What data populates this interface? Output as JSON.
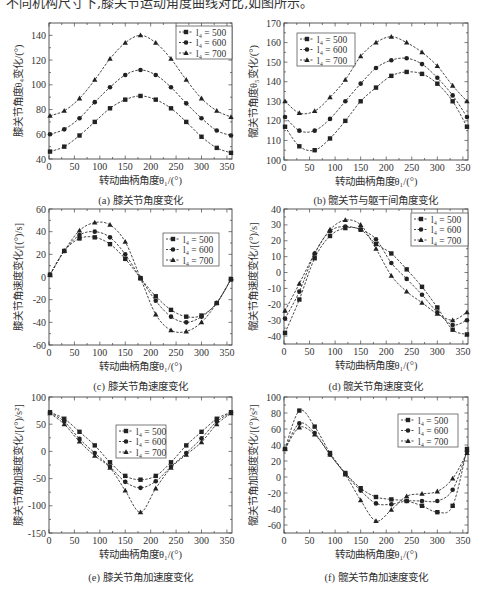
{
  "header": {
    "cropped_text": "不同机构尺寸下,膝关节运动角度曲线对比,如图所示。"
  },
  "common": {
    "xlabel": "转动曲柄角度θ₁/(°)",
    "xticks": [
      0,
      50,
      100,
      150,
      200,
      250,
      300,
      350
    ],
    "legend": [
      "l₄ = 500",
      "l₄ = 600",
      "l₄ = 700"
    ],
    "markers": [
      "square",
      "circle",
      "triangle"
    ]
  },
  "chart_data": [
    {
      "id": "a",
      "type": "line",
      "title": "(a) 膝关节角度变化",
      "xlabel": "转动曲柄角度θ₁/(°)",
      "ylabel": "膝关节角度θ₄变化/(°)",
      "xlim": [
        0,
        360
      ],
      "ylim": [
        40,
        150
      ],
      "yticks": [
        40,
        60,
        80,
        100,
        120,
        140
      ],
      "legend_position": "upper right",
      "x": [
        2,
        30,
        60,
        90,
        120,
        150,
        180,
        210,
        240,
        270,
        300,
        330,
        358
      ],
      "series": [
        {
          "name": "l₄ = 500",
          "marker": "square",
          "values": [
            46,
            50,
            59,
            70,
            81,
            88,
            91,
            88,
            81,
            70,
            58,
            49,
            45
          ]
        },
        {
          "name": "l₄ = 600",
          "marker": "circle",
          "values": [
            60,
            64,
            73,
            86,
            98,
            108,
            112,
            108,
            98,
            85,
            73,
            63,
            59
          ]
        },
        {
          "name": "l₄ = 700",
          "marker": "triangle",
          "values": [
            75,
            79,
            89,
            104,
            121,
            134,
            140,
            134,
            121,
            104,
            89,
            79,
            74
          ]
        }
      ]
    },
    {
      "id": "b",
      "type": "line",
      "title": "(b) 髋关节与躯干间角度变化",
      "xlabel": "转动曲柄角度θ₁/(°)",
      "ylabel": "髋关节角度θ₅变化/(°)",
      "xlim": [
        0,
        360
      ],
      "ylim": [
        100,
        170
      ],
      "yticks": [
        100,
        110,
        120,
        130,
        140,
        150,
        160,
        170
      ],
      "legend_position": "upper left",
      "x": [
        2,
        30,
        60,
        90,
        120,
        150,
        180,
        210,
        240,
        270,
        300,
        330,
        358
      ],
      "series": [
        {
          "name": "l₄ = 500",
          "marker": "square",
          "values": [
            117,
            107,
            105,
            111,
            120,
            130,
            137,
            143,
            145,
            144,
            139,
            130,
            117
          ]
        },
        {
          "name": "l₄ = 600",
          "marker": "circle",
          "values": [
            122,
            115,
            115,
            121,
            130,
            139,
            147,
            151,
            152,
            149,
            142,
            133,
            122
          ]
        },
        {
          "name": "l₄ = 700",
          "marker": "triangle",
          "values": [
            130,
            124,
            125,
            132,
            141,
            153,
            160,
            163,
            160,
            155,
            148,
            138,
            130
          ]
        }
      ]
    },
    {
      "id": "c",
      "type": "line",
      "title": "(c) 膝关节角速度变化",
      "xlabel": "转动曲柄角度θ₁/(°)",
      "ylabel": "膝关节角速度变化/[(°)/s]",
      "xlim": [
        0,
        360
      ],
      "ylim": [
        -60,
        60
      ],
      "yticks": [
        -60,
        -40,
        -20,
        0,
        20,
        40,
        60
      ],
      "legend_position": "center right",
      "x": [
        2,
        30,
        60,
        90,
        120,
        150,
        180,
        210,
        240,
        270,
        300,
        330,
        358
      ],
      "series": [
        {
          "name": "l₄ = 500",
          "marker": "square",
          "values": [
            2,
            23,
            34,
            35,
            29,
            16,
            -1,
            -17,
            -29,
            -35,
            -34,
            -23,
            -2
          ]
        },
        {
          "name": "l₄ = 600",
          "marker": "circle",
          "values": [
            2,
            23,
            37,
            40,
            35,
            20,
            -1,
            -21,
            -35,
            -40,
            -35,
            -23,
            -2
          ]
        },
        {
          "name": "l₄ = 700",
          "marker": "triangle",
          "values": [
            2,
            23,
            41,
            48,
            46,
            31,
            -1,
            -33,
            -47,
            -48,
            -40,
            -23,
            -2
          ]
        }
      ]
    },
    {
      "id": "d",
      "type": "line",
      "title": "(d) 髋关节角速度变化",
      "xlabel": "转动曲柄角度θ₁/(°)",
      "ylabel": "髋关节角速度变化/[(°)/s]",
      "xlim": [
        0,
        360
      ],
      "ylim": [
        -45,
        40
      ],
      "yticks": [
        -40,
        -30,
        -20,
        -10,
        0,
        10,
        20,
        30,
        40
      ],
      "legend_position": "upper right",
      "x": [
        2,
        30,
        60,
        90,
        120,
        150,
        180,
        210,
        240,
        270,
        300,
        330,
        358
      ],
      "series": [
        {
          "name": "l₄ = 500",
          "marker": "square",
          "values": [
            -38,
            -17,
            9,
            23,
            28,
            27,
            18,
            12,
            2,
            -9,
            -22,
            -36,
            -39
          ]
        },
        {
          "name": "l₄ = 600",
          "marker": "circle",
          "values": [
            -29,
            -12,
            12,
            26,
            29,
            27,
            21,
            6,
            -4,
            -14,
            -25,
            -33,
            -30
          ]
        },
        {
          "name": "l₄ = 700",
          "marker": "triangle",
          "values": [
            -24,
            -7,
            12,
            27,
            33,
            30,
            15,
            -2,
            -12,
            -19,
            -26,
            -30,
            -25
          ]
        }
      ]
    },
    {
      "id": "e",
      "type": "line",
      "title": "(e) 膝关节角加速度变化",
      "xlabel": "转动曲柄角度θ₁/(°)",
      "ylabel": "膝关节角加速度变化/[(°)/s²]",
      "xlim": [
        0,
        360
      ],
      "ylim": [
        -150,
        100
      ],
      "yticks": [
        -150,
        -100,
        -50,
        0,
        50,
        100
      ],
      "legend_position": "upper center",
      "x": [
        2,
        30,
        60,
        90,
        120,
        150,
        180,
        210,
        240,
        270,
        300,
        330,
        358
      ],
      "series": [
        {
          "name": "l₄ = 500",
          "marker": "square",
          "values": [
            72,
            60,
            36,
            11,
            -20,
            -45,
            -52,
            -45,
            -20,
            11,
            36,
            60,
            72
          ]
        },
        {
          "name": "l₄ = 600",
          "marker": "circle",
          "values": [
            71,
            55,
            23,
            -3,
            -28,
            -56,
            -67,
            -55,
            -28,
            -3,
            24,
            55,
            71
          ]
        },
        {
          "name": "l₄ = 700",
          "marker": "triangle",
          "values": [
            70,
            50,
            18,
            -8,
            -30,
            -72,
            -112,
            -68,
            -30,
            -6,
            17,
            50,
            70
          ]
        }
      ]
    },
    {
      "id": "f",
      "type": "line",
      "title": "(f) 髋关节角加速度变化",
      "xlabel": "转动曲柄角度θ₁/(°)",
      "ylabel": "髋关节角加速度变化/[(°)/s²]",
      "xlim": [
        0,
        360
      ],
      "ylim": [
        -70,
        100
      ],
      "yticks": [
        -60,
        -40,
        -20,
        0,
        20,
        40,
        60,
        80,
        100
      ],
      "legend_position": "upper right",
      "x": [
        2,
        30,
        60,
        90,
        120,
        150,
        180,
        210,
        240,
        270,
        300,
        330,
        358
      ],
      "series": [
        {
          "name": "l₄ = 500",
          "marker": "square",
          "values": [
            35,
            83,
            63,
            30,
            5,
            -14,
            -25,
            -28,
            -30,
            -36,
            -44,
            -36,
            35
          ]
        },
        {
          "name": "l₄ = 600",
          "marker": "circle",
          "values": [
            35,
            67,
            55,
            28,
            4,
            -17,
            -33,
            -34,
            -30,
            -30,
            -30,
            -16,
            32
          ]
        },
        {
          "name": "l₄ = 700",
          "marker": "triangle",
          "values": [
            35,
            62,
            53,
            28,
            3,
            -29,
            -55,
            -41,
            -24,
            -21,
            -18,
            -2,
            30
          ]
        }
      ]
    }
  ]
}
